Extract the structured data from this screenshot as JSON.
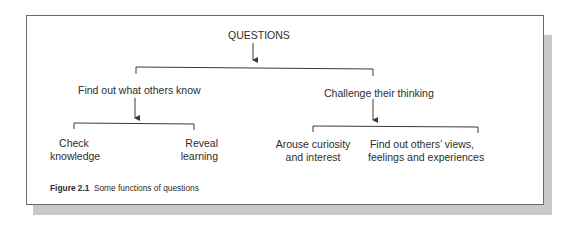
{
  "diagram": {
    "root": "QUESTIONS",
    "branches": [
      {
        "label": "Find out what others know",
        "children": [
          {
            "line1": "Check",
            "line2": "knowledge"
          },
          {
            "line1": "Reveal",
            "line2": "learning"
          }
        ]
      },
      {
        "label": "Challenge their thinking",
        "children": [
          {
            "line1": "Arouse curiosity",
            "line2": "and interest"
          },
          {
            "line1": "Find out others’ views,",
            "line2": "feelings and experiences"
          }
        ]
      }
    ]
  },
  "caption": {
    "number": "Figure 2.1",
    "text": "Some functions of questions"
  },
  "colors": {
    "line": "#3a3a3a",
    "border": "#6b6b6b",
    "shadow": "#c9c9c9"
  }
}
